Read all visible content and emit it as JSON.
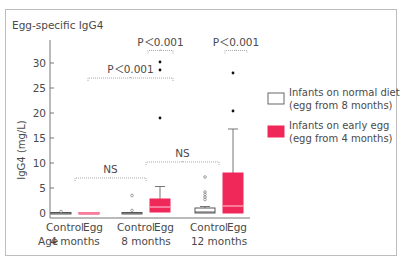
{
  "chart_data": {
    "type": "boxplot",
    "title": "Egg-specific IgG4",
    "ylabel": "IgG4 (mg/L)",
    "xlabel_prefix": "Age",
    "ylim": [
      0,
      33
    ],
    "yticks": [
      0,
      5,
      10,
      15,
      20,
      25,
      30
    ],
    "grid": false,
    "groups": [
      {
        "age": "4 months",
        "labels": [
          "Control",
          "Egg"
        ]
      },
      {
        "age": "8 months",
        "labels": [
          "Control",
          "Egg"
        ]
      },
      {
        "age": "12 months",
        "labels": [
          "Control",
          "Egg"
        ]
      }
    ],
    "series": [
      {
        "name": "Infants on normal diet",
        "note": "(egg from 8 months)",
        "color": "#ffffff",
        "boxes": [
          {
            "group": "4 months",
            "q1": 0,
            "median": 0,
            "q3": 0.1,
            "whisker_low": 0,
            "whisker_high": 0.1,
            "outliers": [
              0.3
            ]
          },
          {
            "group": "8 months",
            "q1": 0,
            "median": 0,
            "q3": 0.1,
            "whisker_low": 0,
            "whisker_high": 0.1,
            "outliers": [
              0.5,
              3.5
            ]
          },
          {
            "group": "12 months",
            "q1": 0,
            "median": 0.2,
            "q3": 1.0,
            "whisker_low": 0,
            "whisker_high": 1.3,
            "outliers": [
              2.7,
              3.2,
              3.7,
              4.2,
              7.2
            ]
          }
        ]
      },
      {
        "name": "Infants on early egg",
        "note": "(egg from 4 months)",
        "color": "#f0285a",
        "boxes": [
          {
            "group": "4 months",
            "q1": 0,
            "median": 0,
            "q3": 0.1,
            "whisker_low": 0,
            "whisker_high": 0.1,
            "outliers": []
          },
          {
            "group": "8 months",
            "q1": 0.2,
            "median": 1.2,
            "q3": 2.8,
            "whisker_low": 0.2,
            "whisker_high": 5.3,
            "outliers": [
              19,
              28.6,
              30.2
            ]
          },
          {
            "group": "12 months",
            "q1": 0,
            "median": 1.4,
            "q3": 8.0,
            "whisker_low": 0,
            "whisker_high": 16.8,
            "outliers": [
              20.4,
              28
            ]
          }
        ]
      }
    ],
    "annotations": [
      {
        "text": "NS",
        "from": "4 months",
        "to": "8 months",
        "level": 7
      },
      {
        "text": "NS",
        "from": "8 months",
        "to": "12 months",
        "level": 10.2
      },
      {
        "text": "P<0.001",
        "from": "4 months",
        "to": "8 months Egg",
        "level": 27
      },
      {
        "text": "P<0.001",
        "from": "8 months Control",
        "to": "8 months Egg",
        "level": 32.5
      },
      {
        "text": "P<0.001",
        "from": "12 months Control",
        "to": "12 months Egg",
        "level": 32.5
      }
    ],
    "legend_position": "right"
  }
}
